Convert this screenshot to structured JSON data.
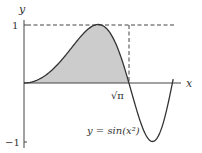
{
  "figure": {
    "axis_labels": {
      "x": "x",
      "y": "y"
    },
    "y_ticks": [
      {
        "value": 1,
        "label": "1"
      },
      {
        "value": -1,
        "label": "−1"
      }
    ],
    "x_marks": [
      {
        "value": 1.7725,
        "label": "√π"
      }
    ],
    "curve_label": "y = sin(x²)",
    "colors": {
      "curve": "#333333",
      "fill": "#cccccc",
      "axes": "#444444",
      "dashed": "#444444"
    }
  },
  "chart_data": {
    "type": "line",
    "title": "",
    "function": "y = sin(x^2)",
    "series": [
      {
        "name": "y = sin(x²)",
        "x": [
          0,
          0.5,
          1.0,
          1.2533,
          1.5,
          1.7725,
          2.0,
          2.1708,
          2.3,
          2.5066
        ],
        "values": [
          0,
          0.247,
          0.841,
          1.0,
          0.778,
          0,
          -0.757,
          -1.0,
          -0.842,
          0
        ]
      }
    ],
    "shaded_region": {
      "from": 0,
      "to": 1.7725,
      "description": "area under curve from 0 to √π"
    },
    "reference_lines": [
      {
        "type": "horizontal",
        "y": 1,
        "style": "dashed"
      },
      {
        "type": "vertical",
        "x": 1.7725,
        "style": "dashed",
        "from_y": 0,
        "to_y": 1
      }
    ],
    "xlabel": "x",
    "ylabel": "y",
    "xlim": [
      0,
      2.6
    ],
    "ylim": [
      -1,
      1
    ]
  }
}
